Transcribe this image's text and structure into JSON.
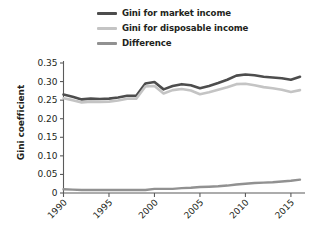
{
  "chart_data": {
    "type": "line",
    "title": "",
    "xlabel": "",
    "ylabel": "Gini coefficient",
    "xlim": [
      1990,
      2016
    ],
    "ylim": [
      0,
      0.35
    ],
    "grid": false,
    "legend_position": "top",
    "y_ticks": [
      "0",
      "0.05",
      "0.10",
      "0.15",
      "0.20",
      "0.25",
      "0.30",
      "0.35"
    ],
    "y_tick_values": [
      0,
      0.05,
      0.1,
      0.15,
      0.2,
      0.25,
      0.3,
      0.35
    ],
    "x_ticks": [
      "1990",
      "1995",
      "2000",
      "2005",
      "2010",
      "2015"
    ],
    "x_tick_values": [
      1990,
      1995,
      2000,
      2005,
      2010,
      2015
    ],
    "x": [
      1990,
      1991,
      1992,
      1993,
      1994,
      1995,
      1996,
      1997,
      1998,
      1999,
      2000,
      2001,
      2002,
      2003,
      2004,
      2005,
      2006,
      2007,
      2008,
      2009,
      2010,
      2011,
      2012,
      2013,
      2014,
      2015,
      2016
    ],
    "series": [
      {
        "name": "Gini for market income",
        "color": "#4d4d4d",
        "values": [
          0.265,
          0.259,
          0.252,
          0.254,
          0.253,
          0.254,
          0.257,
          0.262,
          0.262,
          0.295,
          0.299,
          0.279,
          0.288,
          0.293,
          0.29,
          0.282,
          0.288,
          0.296,
          0.305,
          0.316,
          0.319,
          0.317,
          0.313,
          0.311,
          0.309,
          0.305,
          0.313
        ]
      },
      {
        "name": "Gini for disposable income",
        "color": "#c4c4c4",
        "values": [
          0.255,
          0.25,
          0.244,
          0.246,
          0.245,
          0.246,
          0.249,
          0.254,
          0.254,
          0.287,
          0.288,
          0.268,
          0.277,
          0.28,
          0.276,
          0.266,
          0.271,
          0.278,
          0.285,
          0.293,
          0.294,
          0.29,
          0.285,
          0.282,
          0.278,
          0.272,
          0.277
        ]
      },
      {
        "name": "Difference",
        "color": "#919191",
        "values": [
          0.01,
          0.009,
          0.008,
          0.008,
          0.008,
          0.008,
          0.008,
          0.008,
          0.008,
          0.008,
          0.011,
          0.011,
          0.011,
          0.013,
          0.014,
          0.016,
          0.017,
          0.018,
          0.02,
          0.023,
          0.025,
          0.027,
          0.028,
          0.029,
          0.031,
          0.033,
          0.036
        ]
      }
    ]
  },
  "legend": {
    "items": [
      {
        "label": "Gini for market income",
        "color": "#4d4d4d"
      },
      {
        "label": "Gini for disposable income",
        "color": "#c4c4c4"
      },
      {
        "label": "Difference",
        "color": "#919191"
      }
    ]
  },
  "axes": {
    "y_title": "Gini coefficient"
  }
}
